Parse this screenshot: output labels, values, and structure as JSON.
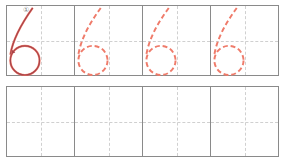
{
  "worksheet": {
    "character": "6",
    "stroke_number_label": "①",
    "colors": {
      "grid_line": "#8a8a8a",
      "guide_line": "#d0d0d0",
      "trace_dashed": "#ef7b6a",
      "model_stroke": "#a9444a"
    },
    "top_row": {
      "cells": [
        {
          "type": "model",
          "label": "6"
        },
        {
          "type": "trace",
          "label": "6"
        },
        {
          "type": "trace",
          "label": "6"
        },
        {
          "type": "trace",
          "label": "6"
        }
      ]
    },
    "bottom_row": {
      "cells": [
        {
          "type": "blank"
        },
        {
          "type": "blank"
        },
        {
          "type": "blank"
        },
        {
          "type": "blank"
        }
      ]
    }
  }
}
